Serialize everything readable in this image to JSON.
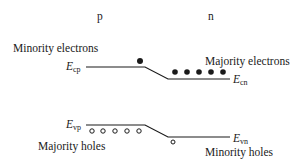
{
  "regions": {
    "p_label": "p",
    "n_label": "n"
  },
  "conduction_band": {
    "p_symbol": "E",
    "p_subscript": "cp",
    "n_symbol": "E",
    "n_subscript": "cn",
    "minority_label": "Minority electrons",
    "majority_label": "Majority electrons",
    "minority_count": 1,
    "majority_count": 5
  },
  "valence_band": {
    "p_symbol": "E",
    "p_subscript": "vp",
    "n_symbol": "E",
    "n_subscript": "vn",
    "majority_label": "Majority holes",
    "minority_label": "Minority holes",
    "majority_count": 5,
    "minority_count": 1
  },
  "colors": {
    "line": "#1a1a1a",
    "background": "#ffffff"
  }
}
